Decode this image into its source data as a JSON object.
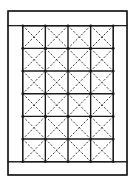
{
  "diagram": {
    "type": "quilt-layout",
    "colors": {
      "background": "#ffffff",
      "line": "#1a1a1a",
      "dashed": "#2a2a2a"
    },
    "outer_frame": {
      "x": 8,
      "y": 11,
      "width": 119,
      "height": 164
    },
    "borders": {
      "top": {
        "x": 8,
        "y": 11,
        "width": 119,
        "height": 14.7
      },
      "bottom": {
        "x": 8,
        "y": 161.7,
        "width": 119,
        "height": 13.3
      },
      "left": {
        "x": 8,
        "y": 25.7,
        "width": 14.7,
        "height": 136
      },
      "right": {
        "x": 113.3,
        "y": 25.7,
        "width": 13.7,
        "height": 136
      }
    },
    "grid": {
      "x": 22.7,
      "y": 25.7,
      "columns": 4,
      "rows": 6,
      "cell_width": 22.65,
      "cell_height": 22.67,
      "cell_pattern": "dashed-x-diagonals",
      "intersection_markers": true
    }
  }
}
